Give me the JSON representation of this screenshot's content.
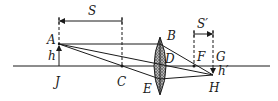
{
  "diagram": {
    "colors": {
      "ink": "#1a1a1a",
      "lens_fill": "#9a9a9a",
      "background": "#ffffff"
    },
    "axis": {
      "x1": 13,
      "x2": 270,
      "y": 66
    },
    "points": {
      "A": {
        "label": "A",
        "x": 59,
        "y": 44,
        "lx": 47,
        "ly": 44
      },
      "J": {
        "label": "J",
        "x": 59,
        "y": 66,
        "lx": 54,
        "ly": 86
      },
      "C": {
        "label": "C",
        "x": 122,
        "y": 66,
        "lx": 117,
        "ly": 86
      },
      "B": {
        "label": "B",
        "x": 160,
        "y": 37,
        "lx": 166,
        "ly": 39
      },
      "D": {
        "label": "D",
        "x": 160,
        "y": 66,
        "lx": 165,
        "ly": 63
      },
      "E": {
        "label": "E",
        "x": 160,
        "y": 95,
        "lx": 143,
        "ly": 93
      },
      "F": {
        "label": "F",
        "x": 194,
        "y": 66,
        "lx": 197,
        "ly": 60
      },
      "G": {
        "label": "G",
        "x": 213,
        "y": 66,
        "lx": 216,
        "ly": 60
      },
      "H": {
        "label": "H",
        "x": 213,
        "y": 75,
        "lx": 210,
        "ly": 92
      }
    },
    "object_height_label": {
      "text": "h",
      "x": 47,
      "y": 60
    },
    "image_height_label": {
      "text": "h′",
      "x": 218,
      "y": 74
    },
    "S": {
      "label": "S",
      "x1": 59,
      "x2": 122,
      "y": 21,
      "lx": 88,
      "ly": 14
    },
    "S_prime": {
      "label": "S′",
      "x1": 194,
      "x2": 213,
      "y": 34,
      "lx": 198,
      "ly": 27
    }
  }
}
